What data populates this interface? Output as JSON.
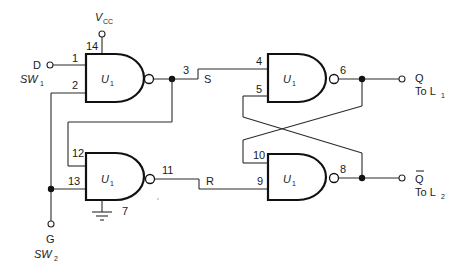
{
  "diagram": {
    "type": "circuit-schematic",
    "power": {
      "label": "V",
      "sub": "CC",
      "pin": "14"
    },
    "ground": {
      "pin": "7"
    },
    "inputs": {
      "d": {
        "label": "D",
        "switch": "SW",
        "switch_sub": "1"
      },
      "g": {
        "label": "G",
        "switch": "SW",
        "switch_sub": "2"
      }
    },
    "outputs": {
      "q": {
        "label": "Q",
        "to": "To L",
        "to_sub": "1"
      },
      "qbar": {
        "label": "Q",
        "overbar": true,
        "to": "To L",
        "to_sub": "2"
      }
    },
    "gates": [
      {
        "id": "gate-1",
        "label": "U",
        "sub": "1",
        "inputs": [
          "1",
          "2"
        ],
        "output": "3"
      },
      {
        "id": "gate-2",
        "label": "U",
        "sub": "1",
        "inputs": [
          "12",
          "13"
        ],
        "output": "11"
      },
      {
        "id": "gate-3",
        "label": "U",
        "sub": "1",
        "inputs": [
          "4",
          "5"
        ],
        "output": "6"
      },
      {
        "id": "gate-4",
        "label": "U",
        "sub": "1",
        "inputs": [
          "10",
          "9"
        ],
        "output": "8"
      }
    ],
    "signals": {
      "s": "S",
      "r": "R"
    }
  }
}
